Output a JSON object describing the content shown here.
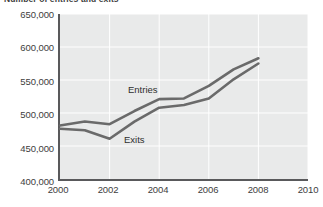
{
  "chart_data": {
    "type": "line",
    "title": "Number of entries and exits",
    "xlabel": "",
    "ylabel": "",
    "xlim": [
      2000,
      2010
    ],
    "ylim": [
      400000,
      650000
    ],
    "x_ticks": [
      "2000",
      "2002",
      "2004",
      "2006",
      "2008",
      "2010"
    ],
    "x_tick_values": [
      2000,
      2002,
      2004,
      2006,
      2008,
      2010
    ],
    "y_ticks": [
      "400,000",
      "450,000",
      "500,000",
      "550,000",
      "600,000",
      "650,000"
    ],
    "y_tick_values": [
      400000,
      450000,
      500000,
      550000,
      600000,
      650000
    ],
    "grid": true,
    "grid_color": "#ffffff",
    "plot_background": "#e9eaea",
    "axis_color": "#59595b",
    "legend": "inline-labels",
    "legend_position": "in-plot",
    "x": [
      2000,
      2001,
      2002,
      2003,
      2004,
      2005,
      2006,
      2007,
      2008
    ],
    "series": [
      {
        "name": "Entries",
        "color": "#6a6a6a",
        "values": [
          481000,
          487000,
          483000,
          503000,
          521000,
          522000,
          541000,
          566000,
          583000
        ]
      },
      {
        "name": "Exits",
        "color": "#6a6a6a",
        "values": [
          476000,
          474000,
          461000,
          487000,
          508000,
          512000,
          522000,
          551000,
          575000
        ]
      }
    ]
  },
  "labels": {
    "entries": "Entries",
    "exits": "Exits"
  }
}
